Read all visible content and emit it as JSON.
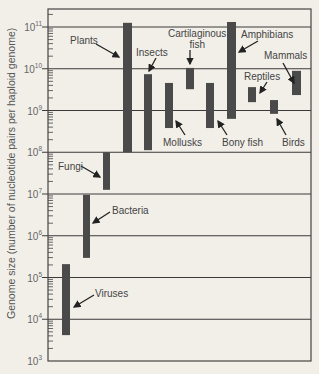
{
  "chart_data": {
    "type": "range-bar",
    "title": "",
    "xlabel": "",
    "ylabel": "Genome size (number of nucleotide pairs per haploid genome)",
    "yscale": "log10",
    "ylim_exponent": [
      3,
      11.4
    ],
    "y_ticks": [
      {
        "base": "10",
        "exp": "11",
        "value": 11
      },
      {
        "base": "10",
        "exp": "10",
        "value": 10
      },
      {
        "base": "10",
        "exp": "9",
        "value": 9
      },
      {
        "base": "10",
        "exp": "8",
        "value": 8
      },
      {
        "base": "10",
        "exp": "7",
        "value": 7
      },
      {
        "base": "10",
        "exp": "6",
        "value": 6
      },
      {
        "base": "10",
        "exp": "5",
        "value": 5
      },
      {
        "base": "10",
        "exp": "4",
        "value": 4
      },
      {
        "base": "10",
        "exp": "3",
        "value": 3
      }
    ],
    "grid": "horizontal at each decade",
    "series": [
      {
        "name": "Viruses",
        "min_exp": 3.62,
        "max_exp": 5.32,
        "x": 62,
        "w": 8,
        "label_x": 95,
        "label_y": 288,
        "arrow": [
          94,
          295,
          74,
          307
        ]
      },
      {
        "name": "Bacteria",
        "min_exp": 5.47,
        "max_exp": 6.98,
        "x": 83,
        "w": 7,
        "label_x": 112,
        "label_y": 205,
        "arrow": [
          110,
          212,
          93,
          223
        ]
      },
      {
        "name": "Fungi",
        "min_exp": 7.1,
        "max_exp": 8.0,
        "x": 103,
        "w": 7,
        "label_x": 58,
        "label_y": 161,
        "arrow": [
          81,
          166,
          100,
          177
        ]
      },
      {
        "name": "Plants",
        "min_exp": 8.0,
        "max_exp": 11.1,
        "x": 123,
        "w": 9,
        "label_x": 70,
        "label_y": 35,
        "arrow": [
          96,
          44,
          119,
          57
        ]
      },
      {
        "name": "Insects",
        "min_exp": 8.05,
        "max_exp": 9.87,
        "x": 144,
        "w": 8,
        "label_x": 136,
        "label_y": 47,
        "arrow": [
          156,
          58,
          149,
          71
        ]
      },
      {
        "name": "Mollusks",
        "min_exp": 8.58,
        "max_exp": 9.66,
        "x": 165,
        "w": 8,
        "label_x": 163,
        "label_y": 137,
        "arrow": [
          185,
          135,
          176,
          121
        ]
      },
      {
        "name": "Cartilaginous fish",
        "lines": [
          "Cartilaginous",
          "fish"
        ],
        "min_exp": 9.51,
        "max_exp": 10.02,
        "x": 186,
        "w": 8,
        "label_x": 168,
        "label_y": 28,
        "arrow": [
          190,
          50,
          190,
          64
        ]
      },
      {
        "name": "Bony fish",
        "min_exp": 8.58,
        "max_exp": 9.66,
        "x": 206,
        "w": 8,
        "label_x": 222,
        "label_y": 137,
        "arrow": [
          227,
          135,
          218,
          121
        ]
      },
      {
        "name": "Amphibians",
        "min_exp": 8.8,
        "max_exp": 11.12,
        "x": 227,
        "w": 9,
        "label_x": 241,
        "label_y": 29,
        "arrow": [
          258,
          41,
          239,
          52
        ]
      },
      {
        "name": "Reptiles",
        "min_exp": 9.2,
        "max_exp": 9.56,
        "x": 248,
        "w": 8,
        "label_x": 244,
        "label_y": 71,
        "arrow": [
          267,
          82,
          260,
          93
        ]
      },
      {
        "name": "Birds",
        "min_exp": 8.92,
        "max_exp": 9.25,
        "x": 270,
        "w": 8,
        "label_x": 282,
        "label_y": 137,
        "arrow": [
          286,
          135,
          277,
          119
        ]
      },
      {
        "name": "Mammals",
        "min_exp": 9.37,
        "max_exp": 9.95,
        "x": 292,
        "w": 9,
        "label_x": 264,
        "label_y": 50,
        "arrow": [
          283,
          63,
          294,
          83
        ]
      }
    ]
  },
  "layout": {
    "plot_left": 48,
    "plot_right": 311,
    "plot_top": 9,
    "plot_bottom": 361,
    "y_at_exp11": 27,
    "px_per_decade": 41.75,
    "bar_color": "#4a4a4a",
    "grid_color": "#3a3a3a",
    "bg_color": "#f2efe9"
  }
}
